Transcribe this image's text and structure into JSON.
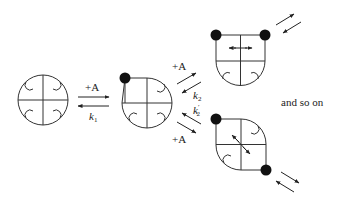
{
  "diagram": {
    "type": "reaction-scheme",
    "colors": {
      "stroke": "#333333",
      "dot": "#111111",
      "background": "#ffffff"
    },
    "states": [
      {
        "id": "state-0",
        "description": "empty circular receptor, four subunits, four binding pockets",
        "bound": 0
      },
      {
        "id": "state-1",
        "description": "one ligand bound at top-left subunit",
        "bound": 1
      },
      {
        "id": "state-2a",
        "description": "two ligands bound at top subunits (adjacent), horizontal interaction",
        "bound": 2
      },
      {
        "id": "state-2b",
        "description": "two ligands bound at diagonal subunits, diagonal interaction",
        "bound": 2
      }
    ],
    "labels": {
      "step1_forward": "+A",
      "step1_reverse": "k",
      "step1_reverse_sub": "1",
      "step2a_forward": "+A",
      "step2a_reverse": "k",
      "step2a_reverse_sub": "2",
      "step2b_reverse": "k",
      "step2b_reverse_sub": "2",
      "step2b_prime": "′",
      "step2b_forward": "+A",
      "continuation": "and so on"
    }
  }
}
